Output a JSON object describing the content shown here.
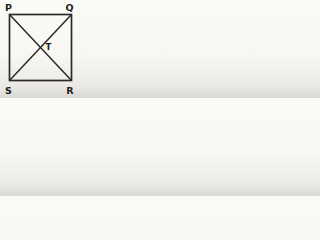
{
  "figure": {
    "type": "geometry-diagram",
    "colors": {
      "line": "#2b2a28",
      "label": "#1e1d1b"
    },
    "square": {
      "x": 9.5,
      "y": 14.5,
      "width": 62,
      "height": 66
    },
    "diagonals": [
      {
        "name": "P-R",
        "x1": 10,
        "y1": 15,
        "x2": 71,
        "y2": 80
      },
      {
        "name": "Q-S",
        "x1": 71,
        "y1": 15,
        "x2": 10,
        "y2": 80
      }
    ],
    "labels": [
      {
        "text": "P",
        "x": 5,
        "y": 10.5
      },
      {
        "text": "Q",
        "x": 73.5,
        "y": 10.5
      },
      {
        "text": "S",
        "x": 5,
        "y": 93.5
      },
      {
        "text": "R",
        "x": 73.5,
        "y": 93.5
      },
      {
        "text": "T",
        "x": 45.5,
        "y": 50
      }
    ]
  }
}
